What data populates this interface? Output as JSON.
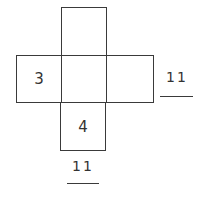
{
  "diagram": {
    "type": "cube-net",
    "faces": [
      {
        "id": "top",
        "value": ""
      },
      {
        "id": "left",
        "value": "3"
      },
      {
        "id": "center",
        "value": ""
      },
      {
        "id": "right",
        "value": ""
      },
      {
        "id": "bottom",
        "value": "4"
      }
    ],
    "answers": {
      "right_blank": "11",
      "bottom_blank": "11"
    },
    "colors": {
      "line": "#3a3a3a",
      "text": "#333333",
      "background": "#ffffff"
    }
  }
}
